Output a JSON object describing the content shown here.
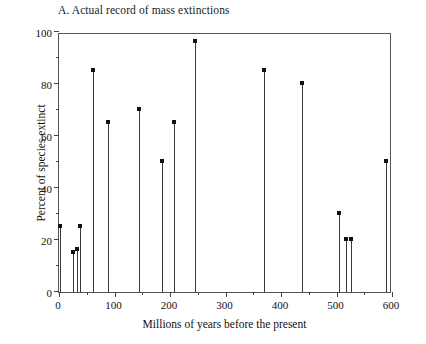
{
  "chart_data": {
    "type": "scatter",
    "title": "A. Actual record of mass extinctions",
    "xlabel": "Millions of years before the present",
    "ylabel": "Percent of species extinct",
    "xlim": [
      0,
      600
    ],
    "ylim": [
      0,
      100
    ],
    "grid": false,
    "legend": null,
    "x_ticks": [
      0,
      100,
      200,
      300,
      400,
      500,
      600
    ],
    "x_tick_labels": [
      "0",
      "100",
      "200",
      "300",
      "400",
      "500",
      "600"
    ],
    "x_minor_ticks": [
      50,
      150,
      250,
      350,
      450,
      550
    ],
    "y_ticks": [
      0,
      20,
      40,
      60,
      80,
      100
    ],
    "y_tick_labels": [
      "0",
      "20",
      "40",
      "60",
      "80",
      "100"
    ],
    "y_minor_ticks": [
      10,
      30,
      50,
      70,
      90
    ],
    "marker": "square",
    "stem": true,
    "x": [
      2,
      25,
      32,
      38,
      62,
      88,
      144,
      185,
      208,
      245,
      370,
      438,
      505,
      518,
      527,
      590
    ],
    "y": [
      25,
      15,
      16,
      25,
      85,
      65,
      70,
      50,
      65,
      96,
      85,
      80,
      30,
      20,
      20,
      50
    ],
    "points": [
      {
        "x": 2,
        "y": 25
      },
      {
        "x": 25,
        "y": 15
      },
      {
        "x": 32,
        "y": 16
      },
      {
        "x": 38,
        "y": 25
      },
      {
        "x": 62,
        "y": 85
      },
      {
        "x": 88,
        "y": 65
      },
      {
        "x": 144,
        "y": 70
      },
      {
        "x": 185,
        "y": 50
      },
      {
        "x": 208,
        "y": 65
      },
      {
        "x": 245,
        "y": 96
      },
      {
        "x": 370,
        "y": 85
      },
      {
        "x": 438,
        "y": 80
      },
      {
        "x": 505,
        "y": 30
      },
      {
        "x": 518,
        "y": 20
      },
      {
        "x": 527,
        "y": 20
      },
      {
        "x": 590,
        "y": 50
      }
    ],
    "colors": {
      "marker": "#111111",
      "stem": "#3a3a3a",
      "axis": "#555555",
      "text": "#111111",
      "background": "#ffffff"
    }
  }
}
